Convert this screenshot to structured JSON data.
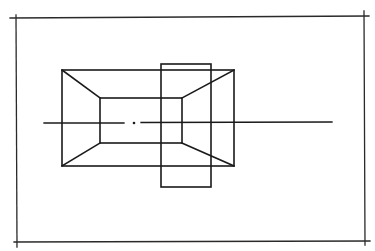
{
  "diagram": {
    "type": "technical-line-drawing",
    "colors": {
      "background": "#ffffff",
      "stroke": "#1a1a1a",
      "frame_stroke": "#2a2a2a"
    },
    "frame": {
      "top": {
        "x1": 10,
        "y1": 18,
        "x2": 369,
        "y2": 16
      },
      "right": {
        "x1": 364,
        "y1": 11,
        "x2": 365,
        "y2": 245
      },
      "bottom": {
        "x1": 14,
        "y1": 242,
        "x2": 370,
        "y2": 241
      },
      "left": {
        "x1": 16,
        "y1": 15,
        "x2": 17,
        "y2": 247
      }
    },
    "outer_rect": {
      "x": 62,
      "y": 70,
      "w": 172,
      "h": 96
    },
    "inner_rect": {
      "x": 100,
      "y": 98,
      "w": 82,
      "h": 45
    },
    "vertical_rect": {
      "x": 161,
      "y": 64,
      "w": 50,
      "h": 123
    },
    "connectors": [
      {
        "name": "top-left",
        "x1": 62,
        "y1": 70,
        "x2": 100,
        "y2": 98
      },
      {
        "name": "top-right",
        "x1": 234,
        "y1": 70,
        "x2": 182,
        "y2": 98
      },
      {
        "name": "bottom-left",
        "x1": 62,
        "y1": 166,
        "x2": 100,
        "y2": 143
      },
      {
        "name": "bottom-right",
        "x1": 234,
        "y1": 166,
        "x2": 182,
        "y2": 143
      }
    ],
    "center_axis": {
      "y": 123,
      "dash1": {
        "x1": 44,
        "x2": 124
      },
      "dot": {
        "cx": 134,
        "cy": 123,
        "r": 1.3
      },
      "dash2": {
        "x1": 141,
        "x2": 332
      }
    }
  }
}
